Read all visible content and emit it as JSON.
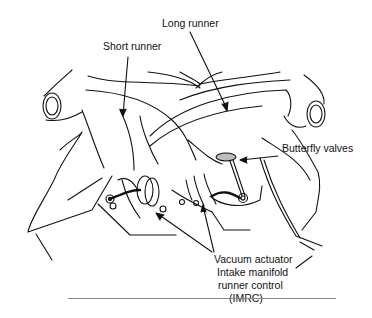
{
  "figure": {
    "labels": {
      "long_runner": "Long runner",
      "short_runner": "Short runner",
      "butterfly_valves": "Butterfly valves",
      "vacuum_actuator": "Vacuum actuator",
      "imrc_line1": "Intake manifold",
      "imrc_line2": "runner control",
      "imrc_line3": "(IMRC)"
    },
    "colors": {
      "line": "#111111",
      "valve_fill": "#bdbdbd",
      "rule": "#888888"
    }
  }
}
